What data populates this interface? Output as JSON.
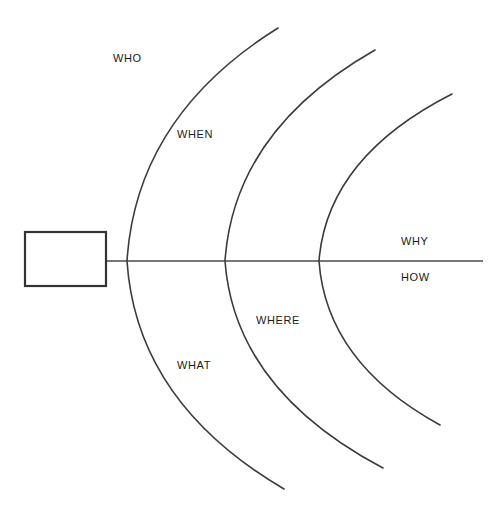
{
  "diagram": {
    "type": "fishbone-cause-and-effect",
    "title": "",
    "canvas": {
      "width": 501,
      "height": 518,
      "background": "#ffffff"
    },
    "colors": {
      "arc_stroke": "#3b3b3b",
      "spine_stroke": "#4a4a4a",
      "box_stroke": "#333333",
      "label_text": "#1a1a1a",
      "background": "#ffffff"
    },
    "effect_box": {
      "label": "",
      "x": 25,
      "y": 232,
      "width": 81,
      "height": 54
    },
    "spine": {
      "y": 261,
      "x_start": 106,
      "x_end": 483
    },
    "arcs": [
      {
        "name": "arc-1",
        "vertex_x": 127,
        "top_end_x": 278,
        "top_end_y": 28,
        "bottom_end_x": 284,
        "bottom_end_y": 489
      },
      {
        "name": "arc-2",
        "vertex_x": 225,
        "top_end_x": 375,
        "top_end_y": 50,
        "bottom_end_x": 383,
        "bottom_end_y": 468
      },
      {
        "name": "arc-3",
        "vertex_x": 319,
        "top_end_x": 452,
        "top_end_y": 94,
        "bottom_end_x": 440,
        "bottom_end_y": 425
      }
    ],
    "labels": [
      {
        "id": "who",
        "text": "WHO",
        "x": 113,
        "y": 53
      },
      {
        "id": "when",
        "text": "WHEN",
        "x": 177,
        "y": 129
      },
      {
        "id": "what",
        "text": "WHAT",
        "x": 177,
        "y": 360
      },
      {
        "id": "where",
        "text": "WHERE",
        "x": 256,
        "y": 315
      },
      {
        "id": "why",
        "text": "WHY",
        "x": 401,
        "y": 236
      },
      {
        "id": "how",
        "text": "HOW",
        "x": 401,
        "y": 272
      }
    ]
  }
}
